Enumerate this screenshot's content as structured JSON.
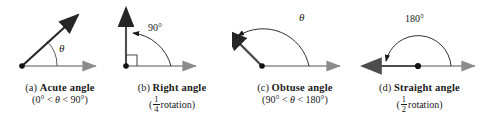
{
  "figure": {
    "background_color": "#ffffff",
    "dark_ray_color": "#262626",
    "light_ray_color": "#8c8c8c",
    "arc_color": "#1a1a1a",
    "text_color": "#1a1a1a"
  },
  "panels": [
    {
      "id": "a",
      "letter": "(a)",
      "name": "Acute angle",
      "condition_prefix": "(0",
      "condition": "(0° < θ < 90°)",
      "condition_parts": {
        "open": "(0",
        "deg1": "°",
        "lt1": " < ",
        "theta": "θ",
        "lt2": " < ",
        "value": "90",
        "deg2": "°",
        "close": ")"
      },
      "angle_label": "θ",
      "angle_degrees": 45,
      "has_right_angle_marker": false,
      "has_arc_arrow": false
    },
    {
      "id": "b",
      "letter": "(b)",
      "name": "Right angle",
      "rotation_numerator": "1",
      "rotation_denominator": "4",
      "rotation_word": "rotation",
      "condition": "(¼ rotation)",
      "angle_label": "90°",
      "angle_degrees": 90,
      "has_right_angle_marker": true,
      "has_arc_arrow": true
    },
    {
      "id": "c",
      "letter": "(c)",
      "name": "Obtuse angle",
      "condition": "(90° < θ < 180°)",
      "condition_parts": {
        "open": "(",
        "value1": "90",
        "deg1": "°",
        "lt1": " < ",
        "theta": "θ",
        "lt2": " < ",
        "value2": "180",
        "deg2": "°",
        "close": ")"
      },
      "angle_label": "θ",
      "angle_degrees": 135,
      "has_right_angle_marker": false,
      "has_arc_arrow": true
    },
    {
      "id": "d",
      "letter": "(d)",
      "name": "Straight angle",
      "rotation_numerator": "1",
      "rotation_denominator": "2",
      "rotation_word": "rotation",
      "condition": "(½ rotation)",
      "angle_label": "180°",
      "angle_degrees": 180,
      "has_right_angle_marker": false,
      "has_arc_arrow": true
    }
  ]
}
